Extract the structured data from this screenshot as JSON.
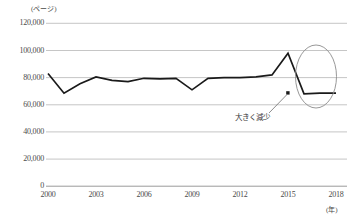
{
  "chart_data": {
    "type": "line",
    "title": "",
    "xlabel": "年",
    "ylabel": "ページ",
    "y_unit_label": "(ページ)",
    "x_unit_label": "(年)",
    "ylim": [
      0,
      120000
    ],
    "xlim": [
      2000,
      2018
    ],
    "y_ticks": [
      0,
      20000,
      40000,
      60000,
      80000,
      100000,
      120000
    ],
    "y_tick_labels": [
      "0",
      "20,000",
      "40,000",
      "60,000",
      "80,000",
      "100,000",
      "120,000"
    ],
    "x_ticks": [
      2000,
      2003,
      2006,
      2009,
      2012,
      2015,
      2018
    ],
    "x_tick_labels": [
      "2000",
      "2003",
      "2006",
      "2009",
      "2012",
      "2015",
      "2018"
    ],
    "grid": true,
    "legend": "none",
    "series": [
      {
        "name": "ページ数",
        "color": "#1a1a1a",
        "x": [
          2000,
          2001,
          2002,
          2003,
          2004,
          2005,
          2006,
          2007,
          2008,
          2009,
          2010,
          2011,
          2012,
          2013,
          2014,
          2015,
          2016,
          2017,
          2018
        ],
        "values": [
          83000,
          68500,
          75500,
          80500,
          78000,
          77000,
          79500,
          79000,
          79500,
          71000,
          79500,
          80000,
          80000,
          80500,
          82000,
          98000,
          68000,
          68500,
          68500
        ]
      }
    ],
    "annotations": [
      {
        "text": "大きく減少",
        "type": "callout",
        "target": "2016-drop",
        "marker": "square-dot"
      },
      {
        "type": "ellipse",
        "label": "highlight-ellipse",
        "covers": "2015-2018"
      }
    ]
  }
}
